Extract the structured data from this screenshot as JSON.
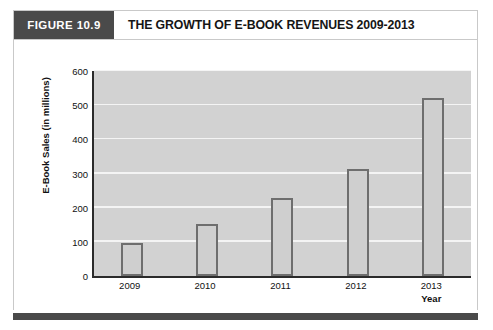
{
  "figure": {
    "tag": "FIGURE 10.9",
    "title": "THE GROWTH OF E-BOOK REVENUES 2009-2013"
  },
  "chart_data": {
    "type": "bar",
    "title": "THE GROWTH OF E-BOOK REVENUES 2009-2013",
    "categories": [
      "2009",
      "2010",
      "2011",
      "2012",
      "2013"
    ],
    "values": [
      97,
      152,
      228,
      313,
      520
    ],
    "xlabel": "Year",
    "ylabel": "E-Book Sales (in millions)",
    "ylim": [
      0,
      600
    ],
    "yticks": [
      0,
      100,
      200,
      300,
      400,
      500,
      600
    ],
    "ytick_labels": [
      "0",
      "100",
      "200",
      "300",
      "400",
      "500",
      "600"
    ],
    "grid": "horizontal",
    "legend": "none",
    "colors": {
      "plot_background": "#d2d2d2",
      "gridline": "#f4f4f4",
      "bar_fill": "#cfcfcf",
      "bar_border": "#6e6e6e",
      "axis": "#2b2b2b",
      "header_tag_background": "#4a4a4a",
      "header_tag_text": "#ffffff",
      "title_text": "#151515"
    }
  }
}
